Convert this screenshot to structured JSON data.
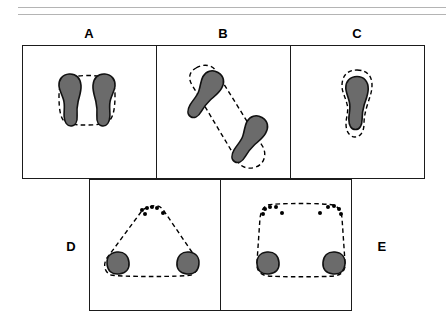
{
  "figure": {
    "title": "",
    "background_color": "#ffffff",
    "width": 447,
    "height": 322,
    "rules": [
      {
        "name": "top-rule-upper",
        "color": "#b4b4b4"
      },
      {
        "name": "top-rule-lower",
        "color": "#b4b4b4"
      }
    ],
    "colors": {
      "foot_fill": "#6b6b6b",
      "foot_stroke": "#111111",
      "dashed_boundary": "#000000",
      "frame": "#1b1b1b",
      "rule": "#b4b4b4",
      "dot": "#000000"
    },
    "panels": [
      {
        "id": "A",
        "label": "A",
        "label_position": "top",
        "description": "Two full footprints side by side, standing, enclosed by a rounded dashed support boundary",
        "foot_count": 2,
        "toe_dot_count": 0,
        "boundary_shape": "rounded-rectangle"
      },
      {
        "id": "B",
        "label": "B",
        "label_position": "top",
        "description": "Two full footprints in diagonal stride, enclosed by an elongated narrow dashed support boundary",
        "foot_count": 2,
        "toe_dot_count": 0,
        "boundary_shape": "elongated-diagonal"
      },
      {
        "id": "C",
        "label": "C",
        "label_position": "top",
        "description": "A single full footprint tightly enclosed by a dashed support boundary",
        "foot_count": 1,
        "toe_dot_count": 0,
        "boundary_shape": "single-foot-outline"
      },
      {
        "id": "D",
        "label": "D",
        "label_position": "left",
        "description": "Two heel contacts at the base and a cluster of toe dots at the apex, enclosed by a triangular dashed support boundary",
        "foot_count": 2,
        "toe_dot_count": 6,
        "boundary_shape": "triangle"
      },
      {
        "id": "E",
        "label": "E",
        "label_position": "right",
        "description": "Two heel contacts at the base and two clusters of toe dots along the top, enclosed by a trapezoidal dashed support boundary",
        "foot_count": 2,
        "toe_dot_count": 10,
        "boundary_shape": "trapezoid"
      }
    ]
  }
}
